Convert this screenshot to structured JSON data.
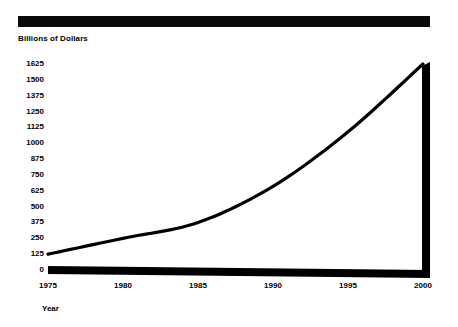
{
  "title_bar": {
    "label": "",
    "redacted": true,
    "color": "#0a0a0a"
  },
  "axis_titles": {
    "y": "Billions of Dollars",
    "x": "Year"
  },
  "chart_data": {
    "type": "line",
    "title": "",
    "xlabel": "Year",
    "ylabel": "Billions of Dollars",
    "x": [
      1975,
      1980,
      1985,
      1990,
      1995,
      2000
    ],
    "values": [
      125,
      250,
      375,
      660,
      1090,
      1625
    ],
    "series": [
      {
        "name": "Billions of Dollars",
        "values": [
          125,
          250,
          375,
          660,
          1090,
          1625
        ]
      }
    ],
    "xlim": [
      1975,
      2000
    ],
    "ylim": [
      0,
      1625
    ],
    "ytick_labels": [
      "1625",
      "1500",
      "1375",
      "1250",
      "1125",
      "1000",
      "875",
      "750",
      "625",
      "500",
      "375",
      "250",
      "125",
      "0"
    ],
    "ytick_values": [
      1625,
      1500,
      1375,
      1250,
      1125,
      1000,
      875,
      750,
      625,
      500,
      375,
      250,
      125,
      0
    ],
    "xtick_labels": [
      "1975",
      "1980",
      "1985",
      "1990",
      "1995",
      "2000"
    ],
    "xtick_values": [
      1975,
      1980,
      1985,
      1990,
      1995,
      2000
    ],
    "grid": false,
    "legend": "none",
    "line_color": "#000000",
    "axis_color": "#000000",
    "background": "#ffffff"
  }
}
